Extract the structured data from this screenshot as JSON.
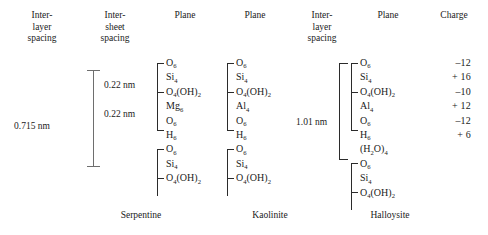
{
  "headers": [
    {
      "name": "interlayer-spacing-left",
      "label": "Inter-\nlayer\nspacing"
    },
    {
      "name": "intersheet-spacing",
      "label": "Inter-\nsheet\nspacing"
    },
    {
      "name": "plane-serpentine",
      "label": "Plane"
    },
    {
      "name": "plane-kaolinite",
      "label": "Plane"
    },
    {
      "name": "interlayer-spacing-right",
      "label": "Inter-\nlayer\nspacing"
    },
    {
      "name": "plane-halloysite",
      "label": "Plane"
    },
    {
      "name": "charge",
      "label": "Charge"
    }
  ],
  "spacings": {
    "serpentine_interlayer": "0.715 nm",
    "serpentine_intersheet_top": "0.22 nm",
    "serpentine_intersheet_bottom": "0.22 nm",
    "halloysite_interlayer": "1.01 nm"
  },
  "minerals": [
    {
      "name": "serpentine",
      "label": "Serpentine"
    },
    {
      "name": "kaolinite",
      "label": "Kaolinite"
    },
    {
      "name": "halloysite",
      "label": "Halloysite"
    }
  ],
  "planes": {
    "serpentine": [
      {
        "base": "O",
        "sub": "6"
      },
      {
        "base": "Si",
        "sub": "4"
      },
      {
        "base": "O",
        "sub": "4",
        "base2": "(OH)",
        "sub2": "2"
      },
      {
        "base": "Mg",
        "sub": "6"
      },
      {
        "base": "O",
        "sub": "6"
      },
      {
        "base": "H",
        "sub": "6"
      },
      {
        "base": "O",
        "sub": "6"
      },
      {
        "base": "Si",
        "sub": "4"
      },
      {
        "base": "O",
        "sub": "4",
        "base2": "(OH)",
        "sub2": "2"
      }
    ],
    "kaolinite": [
      {
        "base": "O",
        "sub": "6"
      },
      {
        "base": "Si",
        "sub": "4"
      },
      {
        "base": "O",
        "sub": "4",
        "base2": "(OH)",
        "sub2": "2"
      },
      {
        "base": "Al",
        "sub": "4"
      },
      {
        "base": "O",
        "sub": "6"
      },
      {
        "base": "H",
        "sub": "6"
      },
      {
        "base": "O",
        "sub": "6"
      },
      {
        "base": "Si",
        "sub": "4"
      },
      {
        "base": "O",
        "sub": "4",
        "base2": "(OH)",
        "sub2": "2"
      }
    ],
    "halloysite": [
      {
        "base": "O",
        "sub": "6"
      },
      {
        "base": "Si",
        "sub": "4"
      },
      {
        "base": "O",
        "sub": "4",
        "base2": "(OH)",
        "sub2": "2"
      },
      {
        "base": "Al",
        "sub": "4"
      },
      {
        "base": "O",
        "sub": "6"
      },
      {
        "base": "H",
        "sub": "6"
      },
      {
        "base": "(H",
        "sub": "2",
        "base2": "O)",
        "sub2": "4"
      },
      {
        "base": "O",
        "sub": "6"
      },
      {
        "base": "Si",
        "sub": "4"
      },
      {
        "base": "O",
        "sub": "4",
        "base2": "(OH)",
        "sub2": "2"
      }
    ]
  },
  "charges": [
    "–12",
    "+ 16",
    "–10",
    "+ 12",
    "–12",
    "+  6"
  ]
}
